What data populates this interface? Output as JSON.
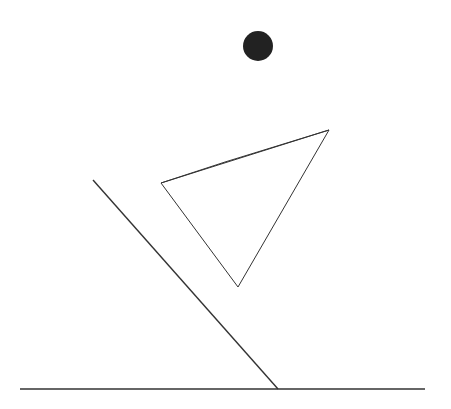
{
  "scene": {
    "width": 451,
    "height": 409,
    "background": "#ffffff",
    "stroke_color": "#333333",
    "fill_color": "#222222",
    "ball": {
      "cx": 258,
      "cy": 46,
      "r": 15
    },
    "triangle": {
      "vertices": [
        [
          161,
          183
        ],
        [
          329,
          130
        ],
        [
          238,
          287
        ]
      ],
      "top_edge_bend": [
        225,
        162
      ]
    },
    "ramp": {
      "x1": 93,
      "y1": 180,
      "x2": 278,
      "y2": 389
    },
    "ground": {
      "x1": 20,
      "y1": 389,
      "x2": 425,
      "y2": 389
    }
  }
}
